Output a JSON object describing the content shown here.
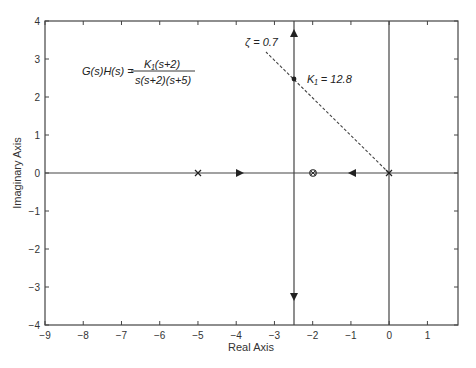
{
  "chart_data": {
    "type": "line",
    "title": "",
    "subtitle": "Root locus",
    "xlabel": "Real Axis",
    "ylabel": "Imaginary Axis",
    "xlim": [
      -9,
      1.8
    ],
    "ylim": [
      -4,
      4
    ],
    "grid": false,
    "x_ticks": [
      -9,
      -8,
      -7,
      -6,
      -5,
      -4,
      -3,
      -2,
      -1,
      0,
      1
    ],
    "x_tick_labels": [
      "−9",
      "−8",
      "−7",
      "−6",
      "−5",
      "−4",
      "−3",
      "−2",
      "−1",
      "0",
      "1"
    ],
    "y_ticks": [
      -4,
      -3,
      -2,
      -1,
      0,
      1,
      2,
      3,
      4
    ],
    "y_tick_labels": [
      "−4",
      "−3",
      "−2",
      "−1",
      "0",
      "1",
      "2",
      "3",
      "4"
    ],
    "transfer_function": {
      "lhs": "G(s)H(s) =",
      "numerator": "K₁(s+2)",
      "denominator": "s(s+2)(s+5)"
    },
    "poles": [
      {
        "re": 0,
        "im": 0,
        "marker": "x"
      },
      {
        "re": -5,
        "im": 0,
        "marker": "x"
      },
      {
        "re": -2,
        "im": 0,
        "marker": "x"
      }
    ],
    "zeros": [
      {
        "re": -2,
        "im": 0,
        "marker": "o"
      }
    ],
    "series": [
      {
        "name": "real-axis branch 1",
        "x": [
          -5,
          -2.5
        ],
        "y": [
          0,
          0
        ]
      },
      {
        "name": "real-axis branch 2",
        "x": [
          0,
          -2.5
        ],
        "y": [
          0,
          0
        ]
      },
      {
        "name": "upper asymptote branch",
        "x": [
          -2.5,
          -2.5
        ],
        "y": [
          0,
          4
        ]
      },
      {
        "name": "lower asymptote branch",
        "x": [
          -2.5,
          -2.5
        ],
        "y": [
          0,
          -4
        ]
      }
    ],
    "direction_arrows": [
      {
        "re": -3.9,
        "im": 0,
        "dir": "right"
      },
      {
        "re": -1.1,
        "im": 0,
        "dir": "left"
      },
      {
        "re": -2.5,
        "im": 3.7,
        "dir": "up"
      },
      {
        "re": -2.5,
        "im": -3.3,
        "dir": "down"
      }
    ],
    "damping_line": {
      "label": "ζ = 0.7",
      "from": {
        "re": 0,
        "im": 0
      },
      "to": {
        "re": -3.2,
        "im": 3.2
      },
      "style": "dashed"
    },
    "operating_point": {
      "re": -2.5,
      "im": 2.5,
      "label": "K₁ = 12.8"
    },
    "reference_lines": [
      {
        "type": "vertical",
        "re": 0
      }
    ]
  },
  "labels": {
    "tf_lhs": "G(s)H(s) =",
    "tf_num": "K₁(s+2)",
    "tf_den": "s(s+2)(s+5)",
    "zeta": "ζ = 0.7",
    "k_point": "K₁ = 12.8",
    "xlabel": "Real Axis",
    "ylabel": "Imaginary Axis"
  }
}
